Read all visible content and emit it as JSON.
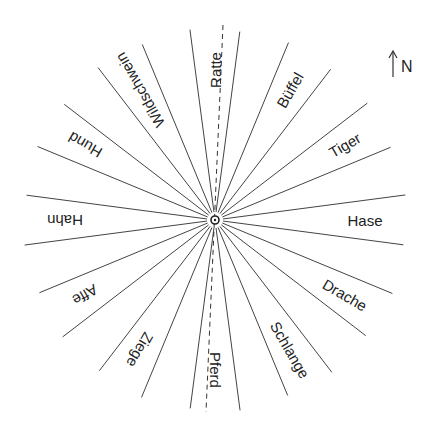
{
  "diagram": {
    "center": [
      215,
      220
    ],
    "line_color": "#444444",
    "north_indicator": {
      "label": "N",
      "arrow": "north-arrow-icon"
    },
    "axis_line": {
      "style": "dashed",
      "top": [
        223,
        25
      ],
      "bottom": [
        206,
        412
      ]
    },
    "sectors": [
      {
        "label": "Ratte",
        "angle": 0
      },
      {
        "label": "Büffel",
        "angle": 30
      },
      {
        "label": "Tiger",
        "angle": 60
      },
      {
        "label": "Hase",
        "angle": 90
      },
      {
        "label": "Drache",
        "angle": 120
      },
      {
        "label": "Schlange",
        "angle": 150
      },
      {
        "label": "Pferd",
        "angle": 180
      },
      {
        "label": "Ziege",
        "angle": 210
      },
      {
        "label": "Affe",
        "angle": 240
      },
      {
        "label": "Hahn",
        "angle": 270
      },
      {
        "label": "Hund",
        "angle": 300
      },
      {
        "label": "Wildschwein",
        "angle": 330
      }
    ]
  }
}
